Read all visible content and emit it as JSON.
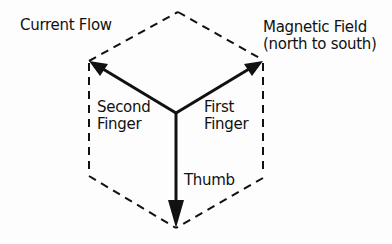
{
  "diagram": {
    "labels": {
      "current_flow": "Current Flow",
      "magnetic_field_line1": "Magnetic Field",
      "magnetic_field_line2": "(north to south)",
      "second_finger_line1": "Second",
      "second_finger_line2": "Finger",
      "first_finger_line1": "First",
      "first_finger_line2": "Finger",
      "thumb": "Thumb"
    },
    "arrows": [
      {
        "name": "second-finger",
        "direction": "up-left",
        "meaning": "Current Flow"
      },
      {
        "name": "first-finger",
        "direction": "up-right",
        "meaning": "Magnetic Field (north to south)"
      },
      {
        "name": "thumb",
        "direction": "down",
        "meaning": "Motion"
      }
    ],
    "colors": {
      "line": "#111111",
      "background": "#fdfdfd"
    }
  }
}
